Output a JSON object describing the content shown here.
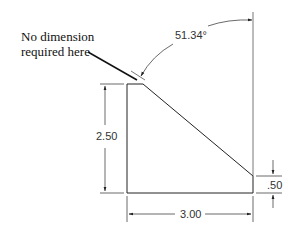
{
  "drawing": {
    "type": "technical-dimension-drawing",
    "note": {
      "line1": "No dimension",
      "line2": "required here"
    },
    "dimensions": {
      "angle": "51.34°",
      "height": "2.50",
      "width": "3.00",
      "small_height": ".50"
    },
    "colors": {
      "object_line": "#222222",
      "dimension_line": "#444444",
      "text": "#333333",
      "background": "#ffffff"
    }
  }
}
